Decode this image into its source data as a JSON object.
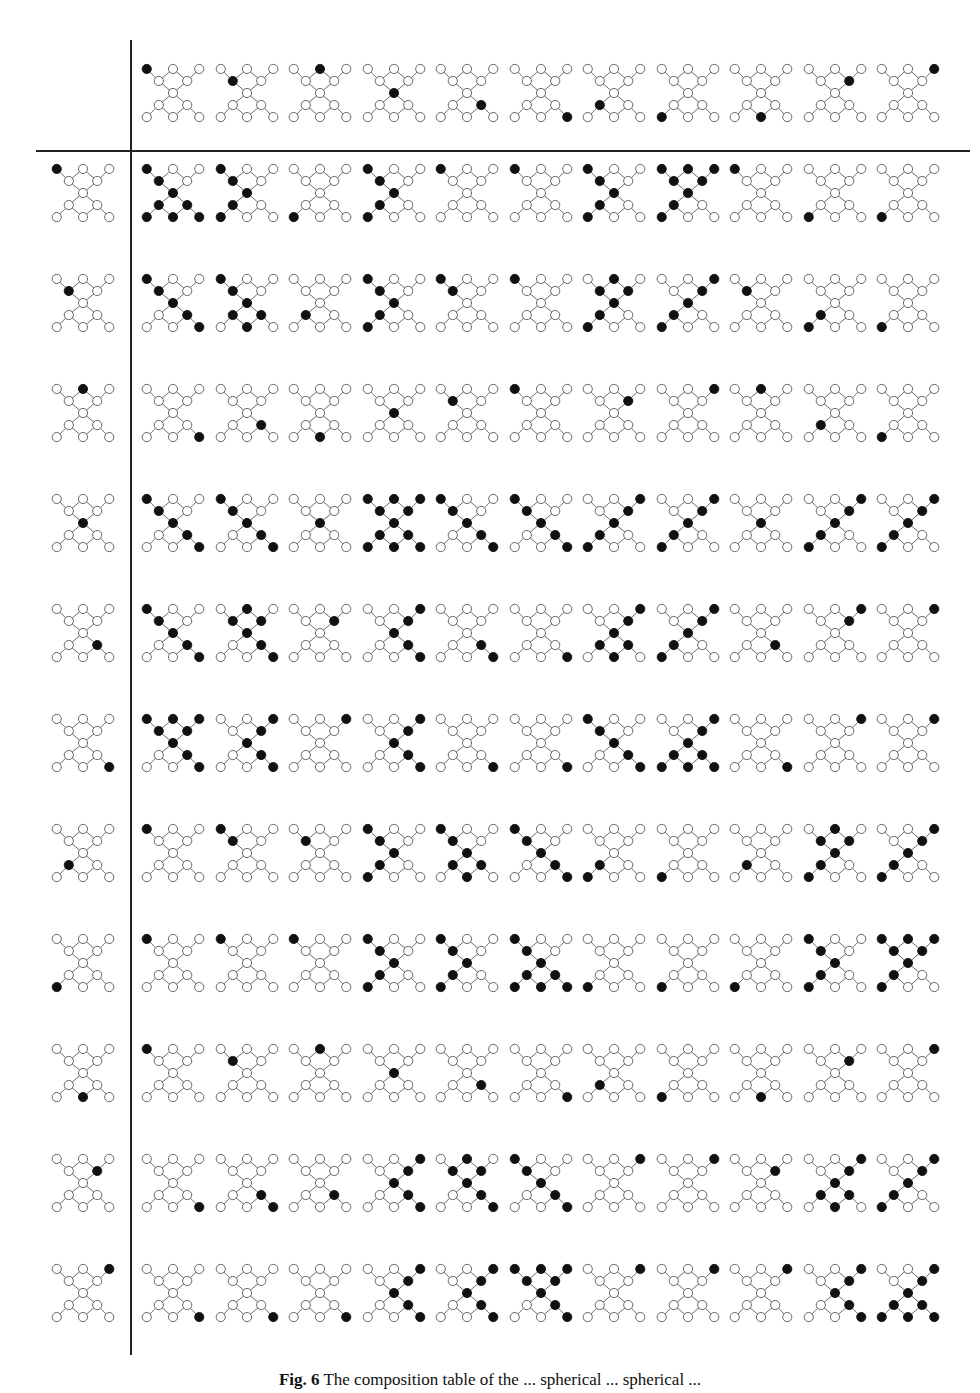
{
  "figure": {
    "caption_label": "Fig. 6",
    "caption_text": "The composition table of the ... spherical ... spherical ...",
    "graph": {
      "node_count": 11,
      "nodes": [
        {
          "id": 0,
          "name": "top-left-pendant",
          "x": 6,
          "y": 10
        },
        {
          "id": 1,
          "name": "top-center",
          "x": 30,
          "y": 10
        },
        {
          "id": 2,
          "name": "top-right-pendant",
          "x": 54,
          "y": 10
        },
        {
          "id": 3,
          "name": "upper-ring-left",
          "x": 17,
          "y": 21
        },
        {
          "id": 4,
          "name": "upper-ring-right",
          "x": 43,
          "y": 21
        },
        {
          "id": 5,
          "name": "center",
          "x": 30,
          "y": 32
        },
        {
          "id": 6,
          "name": "lower-ring-left",
          "x": 17,
          "y": 43
        },
        {
          "id": 7,
          "name": "lower-ring-right",
          "x": 43,
          "y": 43
        },
        {
          "id": 8,
          "name": "bottom-left-pendant",
          "x": 6,
          "y": 54
        },
        {
          "id": 9,
          "name": "bottom-center",
          "x": 30,
          "y": 54
        },
        {
          "id": 10,
          "name": "bottom-right-pendant",
          "x": 54,
          "y": 54
        }
      ],
      "edges": [
        [
          0,
          3
        ],
        [
          2,
          4
        ],
        [
          1,
          3
        ],
        [
          1,
          4
        ],
        [
          3,
          5
        ],
        [
          4,
          5
        ],
        [
          5,
          6
        ],
        [
          5,
          7
        ],
        [
          6,
          9
        ],
        [
          7,
          9
        ],
        [
          6,
          8
        ],
        [
          7,
          10
        ]
      ]
    },
    "header_filled": [
      0,
      3,
      1,
      5,
      7,
      10,
      6,
      8,
      9,
      4,
      2
    ],
    "row_labels_filled": [
      0,
      3,
      1,
      5,
      7,
      10,
      6,
      8,
      9,
      4,
      2
    ],
    "rows": [
      [
        [
          0,
          3,
          5,
          6,
          7,
          8,
          9,
          10
        ],
        [
          0,
          3,
          5,
          6,
          8
        ],
        [
          8
        ],
        [
          0,
          3,
          5,
          6,
          8
        ],
        [
          0
        ],
        [
          0
        ],
        [
          0,
          3,
          5,
          6,
          8
        ],
        [
          0,
          1,
          2,
          3,
          4,
          5,
          6,
          8
        ],
        [
          0
        ],
        [
          8
        ],
        [
          8
        ]
      ],
      [
        [
          0,
          3,
          5,
          7,
          10
        ],
        [
          0,
          3,
          5,
          6,
          7,
          9
        ],
        [
          6
        ],
        [
          0,
          3,
          5,
          6,
          8
        ],
        [
          0,
          3
        ],
        [
          0
        ],
        [
          1,
          3,
          4,
          5,
          6,
          8
        ],
        [
          2,
          4,
          5,
          6,
          8
        ],
        [
          3
        ],
        [
          6,
          8
        ],
        [
          8
        ]
      ],
      [
        [
          10
        ],
        [
          7
        ],
        [
          9
        ],
        [
          5
        ],
        [
          3
        ],
        [
          0
        ],
        [
          4
        ],
        [
          2
        ],
        [
          1
        ],
        [
          6
        ],
        [
          8
        ]
      ],
      [
        [
          0,
          3,
          5,
          7,
          10
        ],
        [
          0,
          3,
          5,
          7,
          10
        ],
        [
          5
        ],
        [
          0,
          1,
          2,
          3,
          4,
          5,
          6,
          7,
          8,
          9,
          10
        ],
        [
          0,
          3,
          5,
          7,
          10
        ],
        [
          0,
          3,
          5,
          7,
          10
        ],
        [
          2,
          4,
          5,
          6,
          8
        ],
        [
          2,
          4,
          5,
          6,
          8
        ],
        [
          5
        ],
        [
          2,
          4,
          5,
          6,
          8
        ],
        [
          2,
          4,
          5,
          6,
          8
        ]
      ],
      [
        [
          0,
          3,
          5,
          7,
          10
        ],
        [
          1,
          3,
          4,
          5,
          7,
          10
        ],
        [
          4
        ],
        [
          2,
          4,
          5,
          7,
          10
        ],
        [
          7,
          10
        ],
        [
          10
        ],
        [
          2,
          4,
          5,
          6,
          7,
          9
        ],
        [
          2,
          4,
          5,
          6,
          8
        ],
        [
          7
        ],
        [
          2,
          4
        ],
        [
          2
        ]
      ],
      [
        [
          0,
          1,
          2,
          3,
          4,
          5,
          7,
          10
        ],
        [
          2,
          4,
          5,
          7,
          10
        ],
        [
          2
        ],
        [
          2,
          4,
          5,
          7,
          10
        ],
        [
          10
        ],
        [
          10
        ],
        [
          0,
          3,
          5,
          7,
          10
        ],
        [
          2,
          4,
          5,
          6,
          7,
          8,
          9,
          10
        ],
        [
          10
        ],
        [
          2
        ],
        [
          2
        ]
      ],
      [
        [
          0
        ],
        [
          0,
          3
        ],
        [
          3
        ],
        [
          0,
          3,
          5,
          6,
          8
        ],
        [
          0,
          3,
          5,
          6,
          7,
          9
        ],
        [
          0,
          3,
          5,
          7,
          10
        ],
        [
          6,
          8
        ],
        [
          8
        ],
        [
          6
        ],
        [
          1,
          3,
          4,
          5,
          6,
          8
        ],
        [
          2,
          4,
          5,
          6,
          8
        ]
      ],
      [
        [
          0
        ],
        [
          0
        ],
        [
          0
        ],
        [
          0,
          3,
          5,
          6,
          8
        ],
        [
          0,
          3,
          5,
          6,
          8
        ],
        [
          0,
          3,
          5,
          6,
          7,
          8,
          9,
          10
        ],
        [
          8
        ],
        [
          8
        ],
        [
          8
        ],
        [
          0,
          3,
          5,
          6,
          8
        ],
        [
          0,
          1,
          2,
          3,
          4,
          5,
          6,
          8
        ]
      ],
      [
        [
          0
        ],
        [
          3
        ],
        [
          1
        ],
        [
          5
        ],
        [
          7
        ],
        [
          10
        ],
        [
          6
        ],
        [
          8
        ],
        [
          9
        ],
        [
          4
        ],
        [
          2
        ]
      ],
      [
        [
          10
        ],
        [
          7,
          10
        ],
        [
          7
        ],
        [
          2,
          4,
          5,
          7,
          10
        ],
        [
          1,
          3,
          4,
          5,
          7,
          10
        ],
        [
          0,
          3,
          5,
          7,
          10
        ],
        [
          2
        ],
        [
          2
        ],
        [
          4
        ],
        [
          2,
          4,
          5,
          6,
          7,
          9
        ],
        [
          2,
          4,
          5,
          6,
          8
        ]
      ],
      [
        [
          10
        ],
        [
          10
        ],
        [
          10
        ],
        [
          2,
          4,
          5,
          7,
          10
        ],
        [
          2,
          4,
          5,
          7,
          10
        ],
        [
          0,
          1,
          2,
          3,
          4,
          5,
          7,
          10
        ],
        [
          2
        ],
        [
          2
        ],
        [
          2
        ],
        [
          2,
          4,
          5,
          7,
          10
        ],
        [
          2,
          4,
          5,
          6,
          7,
          8,
          9,
          10
        ]
      ]
    ],
    "colors": {
      "filled": "#111111",
      "empty": "#ffffff",
      "stroke": "#555555",
      "rule": "#222222"
    }
  }
}
